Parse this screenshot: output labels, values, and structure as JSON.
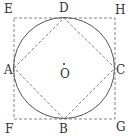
{
  "diagram": {
    "colors": {
      "stroke": "#555555",
      "dashed": "#777777",
      "text": "#333333",
      "background": "#ffffff"
    },
    "circle": {
      "cx": 64,
      "cy": 68,
      "r": 50
    },
    "square": {
      "x": 14,
      "y": 18,
      "w": 101,
      "h": 101
    },
    "center": {
      "x": 64,
      "y": 66
    },
    "points": {
      "A": {
        "x": 14,
        "y": 68
      },
      "B": {
        "x": 64,
        "y": 119
      },
      "C": {
        "x": 115,
        "y": 68
      },
      "D": {
        "x": 64,
        "y": 18
      }
    },
    "labels": {
      "E": "E",
      "D": "D",
      "H": "H",
      "A": "A",
      "O": "O",
      "C": "C",
      "F": "F",
      "B": "B",
      "G": "G"
    }
  }
}
